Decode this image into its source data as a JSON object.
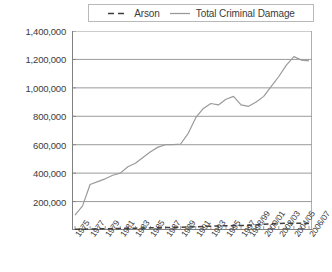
{
  "legend": {
    "position": "top-center",
    "entries": [
      {
        "label": "Arson",
        "icon": "dashed-line-swatch",
        "style": "dashed",
        "color": "#3f3f3f"
      },
      {
        "label": "Total Criminal Damage",
        "icon": "solid-line-swatch",
        "style": "solid",
        "color": "#9a9a9a"
      }
    ]
  },
  "colors": {
    "arson": "#3f3f3f",
    "total": "#9a9a9a",
    "gridline": "#808080",
    "axis": "#808080",
    "text": "#3b3b3b",
    "background": "#ffffff"
  },
  "chart_data": {
    "type": "line",
    "title": "",
    "xlabel": "",
    "ylabel": "",
    "ylim": [
      0,
      1400000
    ],
    "ytick_step": 200000,
    "ytick_labels": [
      "1,400,000",
      "1,200,000",
      "1,000,000",
      "800,000",
      "600,000",
      "400,000",
      "200,000"
    ],
    "ytick_values": [
      1400000,
      1200000,
      1000000,
      800000,
      600000,
      400000,
      200000
    ],
    "grid": true,
    "legend_position": "top",
    "x": [
      "1975",
      "1976",
      "1977",
      "1978",
      "1979",
      "1980",
      "1981",
      "1982",
      "1983",
      "1984",
      "1985",
      "1986",
      "1987",
      "1988",
      "1989",
      "1990",
      "1991",
      "1992",
      "1993",
      "1994",
      "1995",
      "1996",
      "1997",
      "1998/99",
      "1999/00",
      "2000/01",
      "2001/02",
      "2002/03",
      "2003/04",
      "2004/05",
      "2005/06",
      "2006/07"
    ],
    "xtick_labels_shown": [
      "1975",
      "1977",
      "1979",
      "1981",
      "1983",
      "1985",
      "1987",
      "1989",
      "1991",
      "1993",
      "1995",
      "1997",
      "1998/99",
      "2000/01",
      "2002/03",
      "2004/05",
      "2006/07"
    ],
    "series": [
      {
        "name": "Total Criminal Damage",
        "style": "solid",
        "color": "#9a9a9a",
        "values": [
          105000,
          170000,
          320000,
          340000,
          360000,
          385000,
          400000,
          445000,
          470000,
          510000,
          550000,
          583000,
          600000,
          600000,
          605000,
          680000,
          790000,
          855000,
          890000,
          880000,
          920000,
          940000,
          880000,
          870000,
          900000,
          940000,
          1010000,
          1080000,
          1160000,
          1220000,
          1195000,
          1190000
        ]
      },
      {
        "name": "Arson",
        "style": "dashed",
        "color": "#3f3f3f",
        "values": [
          5000,
          6000,
          7000,
          8000,
          9000,
          10000,
          11000,
          12000,
          13000,
          14000,
          15000,
          16000,
          17000,
          18000,
          19000,
          21000,
          23000,
          25000,
          27000,
          28000,
          30000,
          31000,
          32000,
          33000,
          36000,
          40000,
          44000,
          46000,
          47000,
          48000,
          47000,
          45000
        ]
      }
    ]
  }
}
